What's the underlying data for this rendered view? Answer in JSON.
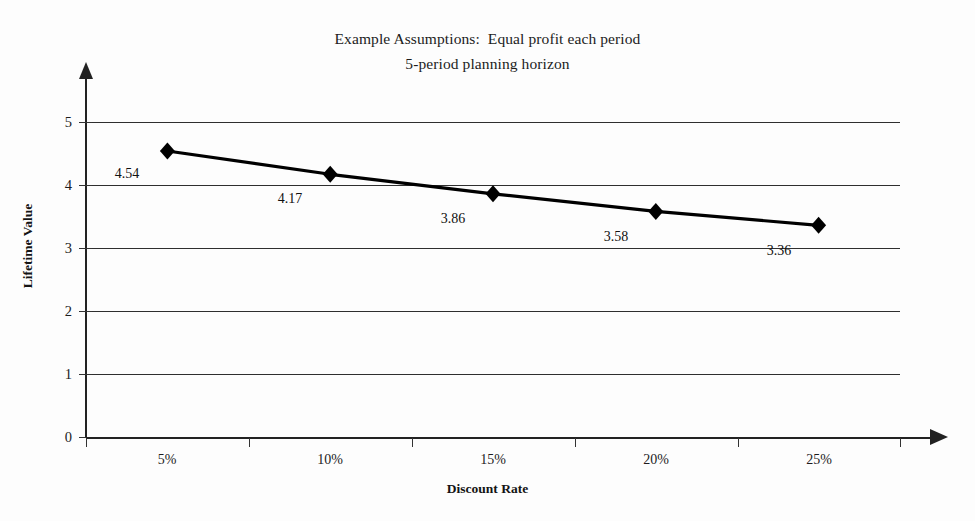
{
  "chart_data": {
    "type": "line",
    "title": "Example Assumptions:  Equal profit each period\n5-period planning horizon",
    "title_lines": [
      "Example Assumptions:  Equal profit each period",
      "5-period planning horizon"
    ],
    "xlabel": "Discount Rate",
    "ylabel": "Lifetime Value",
    "categories": [
      "5%",
      "10%",
      "15%",
      "20%",
      "25%"
    ],
    "values": [
      4.54,
      4.17,
      3.86,
      3.58,
      3.36
    ],
    "point_labels": [
      "4.54",
      "4.17",
      "3.86",
      "3.58",
      "3.36"
    ],
    "series": [
      {
        "name": "Lifetime Value",
        "values": [
          4.54,
          4.17,
          3.86,
          3.58,
          3.36
        ]
      }
    ],
    "ylim": [
      0,
      5
    ],
    "yticks": [
      0,
      1,
      2,
      3,
      4,
      5
    ],
    "ytick_labels": [
      "0",
      "1",
      "2",
      "3",
      "4",
      "5"
    ],
    "grid": true,
    "grid_axis": "y",
    "legend": "none",
    "marker": "diamond",
    "line_color": "#000000",
    "marker_color": "#000000",
    "grid_color": "#2f2f2f",
    "axis_color": "#222222",
    "background_color": "#fdfdfd"
  }
}
